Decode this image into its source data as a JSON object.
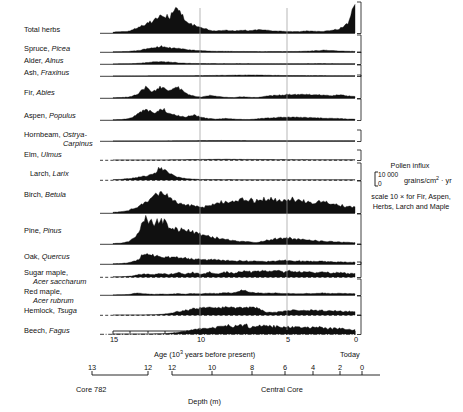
{
  "figure": {
    "title_hidden": "",
    "axes": {
      "age_axis": {
        "label": "Age (10³ years before present)",
        "label_plain": "Age (10",
        "label_sup": "3",
        "label_tail": " years before present)",
        "ticks": [
          15,
          10,
          5,
          0
        ],
        "tick_positions_px": [
          113,
          200,
          287,
          355
        ],
        "today_label": "Today",
        "minor_ticks_px": [
          113,
          130,
          148,
          165,
          183,
          200,
          217,
          235,
          252,
          270,
          287,
          304,
          321,
          338,
          355
        ]
      },
      "depth_axis": {
        "label": "Depth (m)",
        "core_label": "Core",
        "core_number": "782",
        "central_core_label": "Central Core",
        "core782_ticks": [
          13,
          12
        ],
        "core782_tick_positions_px": [
          92,
          148
        ],
        "central_ticks": [
          12,
          10,
          8,
          6,
          4,
          2,
          0
        ],
        "central_tick_positions_px": [
          172,
          212,
          252,
          285,
          313,
          340,
          362
        ]
      }
    },
    "legend": {
      "title": "Pollen influx",
      "scale_top": "10 000",
      "scale_bottom": "0",
      "units_plain": "grains/cm",
      "units_sup": "2",
      "units_tail": " · yr",
      "note_line1": "scale 10 × for Fir, Aspen,",
      "note_line2": "Herbs, Larch and Maple"
    },
    "reference_lines": {
      "x_positions_px": [
        200,
        287
      ],
      "color": "#9a9a9a"
    },
    "ink_color": "#101010"
  },
  "chart_data": {
    "type": "area",
    "xlabel": "Age (10³ years before present)",
    "ylabel": "Pollen influx (grains/cm² · yr)",
    "xlim": [
      15,
      0
    ],
    "ylim": [
      0,
      10000
    ],
    "grid": false,
    "legend_position": "right",
    "x_note": "x runs right-to-left: 15 ka at left to 0 (Today) at right",
    "x": [
      15.0,
      14.5,
      14.0,
      13.5,
      13.0,
      12.5,
      12.0,
      11.5,
      11.0,
      10.5,
      10.0,
      9.5,
      9.0,
      8.5,
      8.0,
      7.5,
      7.0,
      6.5,
      6.0,
      5.5,
      5.0,
      4.5,
      4.0,
      3.5,
      3.0,
      2.5,
      2.0,
      1.5,
      1.0,
      0.5,
      0.0
    ],
    "series": [
      {
        "name": "Total herbs",
        "label_common": "Total herbs",
        "label_latin": "",
        "exaggerated": true,
        "baseline_style": "solid",
        "values": [
          300,
          450,
          700,
          1500,
          3000,
          4200,
          6500,
          5200,
          8500,
          4000,
          2600,
          1700,
          900,
          700,
          850,
          700,
          900,
          800,
          1100,
          900,
          700,
          600,
          500,
          450,
          700,
          600,
          500,
          900,
          1400,
          3000,
          9000
        ]
      },
      {
        "name": "Spruce",
        "label_common": "Spruce,",
        "label_latin": "Picea",
        "exaggerated": false,
        "baseline_style": "solid",
        "values": [
          120,
          200,
          400,
          900,
          1700,
          2600,
          3400,
          2900,
          2400,
          1600,
          1100,
          800,
          600,
          450,
          400,
          350,
          300,
          280,
          260,
          250,
          250,
          260,
          300,
          350,
          500,
          750,
          1100,
          900,
          600,
          450,
          400
        ]
      },
      {
        "name": "Alder",
        "label_common": "Alder,",
        "label_latin": "Alnus",
        "exaggerated": false,
        "baseline_style": "solid",
        "values": [
          80,
          120,
          260,
          600,
          1200,
          1800,
          2200,
          1700,
          1100,
          700,
          500,
          400,
          350,
          300,
          300,
          280,
          300,
          320,
          300,
          280,
          260,
          250,
          280,
          300,
          320,
          340,
          360,
          340,
          300,
          280,
          260
        ]
      },
      {
        "name": "Ash",
        "label_common": "Ash,",
        "label_latin": "Fraxinus",
        "exaggerated": false,
        "baseline_style": "solid",
        "values": [
          40,
          50,
          70,
          90,
          120,
          150,
          180,
          200,
          220,
          250,
          320,
          420,
          520,
          600,
          700,
          800,
          900,
          1000,
          950,
          800,
          600,
          500,
          450,
          420,
          400,
          380,
          360,
          340,
          320,
          300,
          280
        ]
      },
      {
        "name": "Fir",
        "label_common": "Fir,",
        "label_latin": "Abies",
        "exaggerated": true,
        "baseline_style": "solid",
        "values": [
          100,
          200,
          500,
          1600,
          4800,
          3200,
          5200,
          3000,
          5300,
          2200,
          900,
          400,
          1200,
          700,
          300,
          200,
          600,
          300,
          250,
          900,
          1100,
          1400,
          1600,
          1500,
          1700,
          1500,
          1300,
          1100,
          1400,
          1000,
          600
        ]
      },
      {
        "name": "Aspen",
        "label_common": "Aspen,",
        "label_latin": "Populus",
        "exaggerated": true,
        "baseline_style": "solid",
        "values": [
          150,
          250,
          700,
          2600,
          5400,
          3400,
          5600,
          3200,
          2200,
          1400,
          2400,
          1300,
          700,
          400,
          800,
          500,
          300,
          250,
          600,
          900,
          1100,
          1300,
          1500,
          1400,
          1200,
          1100,
          900,
          800,
          700,
          500,
          350
        ]
      },
      {
        "name": "Hornbeam",
        "label_common": "Hornbeam,",
        "label_latin": "Ostrya-",
        "label_latin2": "Carpinus",
        "exaggerated": false,
        "baseline_style": "solid",
        "values": [
          30,
          35,
          40,
          45,
          50,
          60,
          80,
          120,
          180,
          240,
          320,
          400,
          450,
          480,
          460,
          420,
          380,
          340,
          320,
          300,
          280,
          260,
          250,
          240,
          230,
          220,
          210,
          200,
          200,
          190,
          180
        ]
      },
      {
        "name": "Elm",
        "label_common": "Elm,",
        "label_latin": "Ulmus",
        "exaggerated": false,
        "baseline_style": "dashed",
        "values": [
          0,
          0,
          0,
          0,
          0,
          20,
          60,
          140,
          260,
          400,
          520,
          620,
          700,
          760,
          780,
          760,
          700,
          640,
          580,
          520,
          480,
          440,
          420,
          400,
          380,
          360,
          340,
          320,
          300,
          280,
          260
        ]
      },
      {
        "name": "Larch",
        "label_common": "Larch,",
        "label_latin": "Larix",
        "exaggerated": true,
        "baseline_style": "dashed",
        "values": [
          200,
          400,
          900,
          1600,
          2400,
          3600,
          8200,
          4200,
          1800,
          900,
          500,
          350,
          300,
          260,
          240,
          220,
          210,
          200,
          200,
          190,
          190,
          180,
          180,
          180,
          170,
          170,
          170,
          160,
          160,
          160,
          150
        ]
      },
      {
        "name": "Birch",
        "label_common": "Birch,",
        "label_latin": "Betula",
        "exaggerated": false,
        "baseline_style": "solid",
        "values": [
          200,
          400,
          900,
          1800,
          3400,
          5200,
          6800,
          5400,
          3600,
          2600,
          2400,
          1900,
          2600,
          3200,
          3600,
          3900,
          4200,
          4300,
          4000,
          4600,
          4200,
          3800,
          4400,
          4000,
          3600,
          3400,
          3800,
          3200,
          2600,
          2200,
          1800
        ]
      },
      {
        "name": "Pine",
        "label_common": "Pine,",
        "label_latin": "Pinus",
        "exaggerated": false,
        "baseline_style": "solid",
        "values": [
          150,
          300,
          900,
          3200,
          8400,
          7600,
          8000,
          6200,
          4800,
          5200,
          4400,
          3200,
          2600,
          2000,
          1600,
          1200,
          900,
          700,
          600,
          1200,
          1800,
          2000,
          1900,
          1600,
          1400,
          1200,
          1000,
          800,
          700,
          600,
          500
        ]
      },
      {
        "name": "Oak",
        "label_common": "Oak,",
        "label_latin": "Quercus",
        "exaggerated": false,
        "baseline_style": "solid",
        "values": [
          120,
          250,
          700,
          2200,
          5600,
          4400,
          4200,
          3400,
          3800,
          3000,
          2600,
          2400,
          2200,
          2000,
          1800,
          1700,
          1600,
          1500,
          1400,
          1300,
          1600,
          2000,
          1800,
          1600,
          1500,
          1400,
          1300,
          1200,
          1100,
          1000,
          900
        ]
      },
      {
        "name": "Sugar maple",
        "label_common": "Sugar maple,",
        "label_latin": "Acer saccharum",
        "exaggerated": true,
        "baseline_style": "dashed",
        "values": [
          100,
          200,
          500,
          1400,
          2200,
          1600,
          2600,
          1800,
          3000,
          2000,
          3200,
          2200,
          3400,
          2400,
          3600,
          2600,
          4200,
          3600,
          4600,
          3800,
          5000,
          3600,
          4400,
          3400,
          4000,
          3000,
          3600,
          2800,
          3200,
          2600,
          2400
        ]
      },
      {
        "name": "Red maple",
        "label_common": "Red maple,",
        "label_latin": "Acer rubrum",
        "exaggerated": true,
        "baseline_style": "solid",
        "values": [
          80,
          120,
          400,
          1400,
          800,
          400,
          700,
          500,
          900,
          600,
          1000,
          700,
          1200,
          900,
          1600,
          1400,
          3600,
          1800,
          1400,
          1100,
          1300,
          900,
          1100,
          800,
          1000,
          900,
          1400,
          1000,
          1200,
          900,
          800
        ]
      },
      {
        "name": "Hemlock",
        "label_common": "Hemlock,",
        "label_latin": "Tsuga",
        "exaggerated": false,
        "baseline_style": "dashed",
        "values": [
          0,
          0,
          0,
          20,
          60,
          150,
          400,
          900,
          1800,
          2600,
          3400,
          3800,
          4000,
          4200,
          4100,
          4300,
          4200,
          4400,
          4000,
          1400,
          1300,
          2200,
          2600,
          2400,
          2600,
          2500,
          2400,
          2300,
          2200,
          2000,
          1800
        ]
      },
      {
        "name": "Beech",
        "label_common": "Beech,",
        "label_latin": "Fagus",
        "exaggerated": false,
        "baseline_style": "dashdot",
        "values": [
          0,
          0,
          0,
          0,
          20,
          60,
          150,
          400,
          900,
          1600,
          2400,
          3000,
          3400,
          3800,
          4600,
          4200,
          5400,
          4000,
          4400,
          4800,
          4200,
          3800,
          4000,
          3600,
          3400,
          4200,
          3600,
          3000,
          3200,
          2600,
          2200
        ]
      }
    ]
  }
}
